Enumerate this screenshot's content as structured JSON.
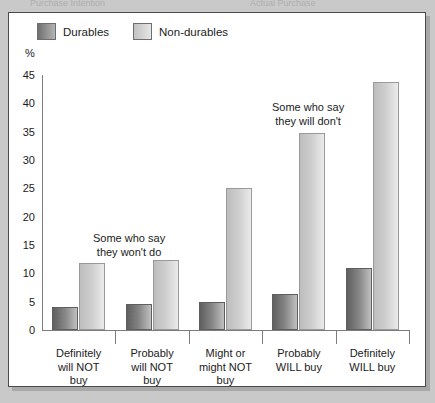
{
  "top_cut_text": {
    "left": "Purchase Intention",
    "right": "Actual Purchase"
  },
  "figure": {
    "ylabel": "%",
    "legend": [
      {
        "label": "Durables",
        "swatch": "dark-gray-gradient",
        "color": "#868686"
      },
      {
        "label": "Non-durables",
        "swatch": "light-gray-gradient",
        "color": "#cfcfcf"
      }
    ],
    "annotations": [
      {
        "name": "annotation-some-who-say-they-wont-do",
        "lines": [
          "Some who say",
          "they won't do"
        ]
      },
      {
        "name": "annotation-some-who-say-they-will-dont",
        "lines": [
          "Some who say",
          "they will don't"
        ]
      }
    ]
  },
  "chart_data": {
    "type": "bar",
    "title": "",
    "xlabel": "",
    "ylabel": "%",
    "ylim": [
      0,
      45
    ],
    "yticks": [
      0,
      5,
      10,
      15,
      20,
      25,
      30,
      35,
      40,
      45
    ],
    "grid": false,
    "legend_position": "top-left",
    "categories": [
      "Definitely will NOT buy",
      "Probably will NOT buy",
      "Might or might NOT buy",
      "Probably WILL buy",
      "Definitely WILL buy"
    ],
    "category_lines": [
      [
        "Definitely",
        "will NOT",
        "buy"
      ],
      [
        "Probably",
        "will NOT",
        "buy"
      ],
      [
        "Might or",
        "might NOT",
        "buy"
      ],
      [
        "Probably",
        "WILL buy"
      ],
      [
        "Definitely",
        "WILL buy"
      ]
    ],
    "series": [
      {
        "name": "Durables",
        "values": [
          4.0,
          4.6,
          5.0,
          6.4,
          11.0
        ]
      },
      {
        "name": "Non-durables",
        "values": [
          11.9,
          12.3,
          25.0,
          34.7,
          43.7
        ]
      }
    ]
  }
}
